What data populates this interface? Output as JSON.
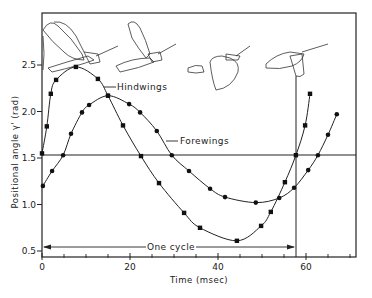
{
  "chart_data": {
    "type": "line",
    "title": "",
    "xlabel": "Time (msec)",
    "ylabel": "Positional angle γ' (rad)",
    "xlim": [
      0,
      72
    ],
    "ylim": [
      0.45,
      3.0
    ],
    "x_ticks": [
      0,
      20,
      40,
      60
    ],
    "x_tick_labels": [
      "0",
      "20",
      "40",
      "60"
    ],
    "x_minor_tick_step": 5,
    "y_ticks": [
      0.5,
      1.0,
      1.5,
      2.0,
      2.5
    ],
    "y_tick_labels": [
      "0.5",
      "1.0",
      "1.5",
      "2.0",
      "2.5"
    ],
    "grid": false,
    "legend": "inline labels",
    "series": [
      {
        "name": "Hindwings",
        "marker": "square",
        "x": [
          0,
          1.1,
          2.0,
          3.2,
          7.7,
          12.7,
          15.0,
          18.4,
          22.5,
          26.6,
          32.3,
          35.9,
          44.3,
          49.8,
          52.0,
          55.2,
          57.7,
          59.8,
          60.9
        ],
        "y": [
          1.55,
          1.84,
          2.19,
          2.34,
          2.48,
          2.35,
          2.17,
          1.85,
          1.52,
          1.23,
          0.91,
          0.75,
          0.61,
          0.77,
          0.92,
          1.24,
          1.53,
          1.85,
          2.19
        ]
      },
      {
        "name": "Forewings",
        "marker": "circle",
        "x": [
          0.2,
          2.3,
          4.8,
          6.6,
          9.1,
          10.7,
          15.0,
          19.8,
          22.3,
          26.1,
          29.5,
          33.4,
          38.2,
          41.6,
          48.6,
          53.9,
          57.3,
          60.5,
          62.7,
          65.0,
          67.0
        ],
        "y": [
          1.2,
          1.36,
          1.53,
          1.76,
          1.99,
          2.07,
          2.17,
          2.08,
          1.99,
          1.79,
          1.53,
          1.36,
          1.17,
          1.08,
          1.02,
          1.07,
          1.18,
          1.37,
          1.53,
          1.75,
          1.97
        ]
      }
    ],
    "reference_lines": {
      "horizontal_y": 1.53,
      "vertical_x": 57.7
    },
    "annotations": [
      {
        "text": "Hindwings",
        "target": "Hindwings curve",
        "at_x": 16.5,
        "at_y": 2.32
      },
      {
        "text": "Forewings",
        "target": "Forewings curve",
        "at_x": 30.5,
        "at_y": 1.6
      },
      {
        "text": "One cycle",
        "type": "double-arrow",
        "from_x": 0,
        "to_x": 57.7,
        "y": 0.53
      }
    ],
    "illustrations": [
      "locust-wing-position-1",
      "locust-wing-position-2",
      "locust-wing-position-3",
      "locust-wing-position-4"
    ]
  },
  "labels": {
    "xlabel": "Time (msec)",
    "ylabel": "Positional angle γ' (rad)",
    "hindwings": "Hindwings",
    "forewings": "Forewings",
    "one_cycle": "One cycle"
  }
}
